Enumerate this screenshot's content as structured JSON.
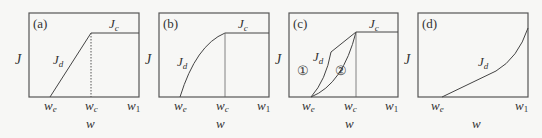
{
  "figure": {
    "panels": [
      {
        "id": "a",
        "panel_label": "(a)",
        "y_label": "J",
        "x_label": "w",
        "x_ticks": [
          "w_e",
          "w_c",
          "w_1"
        ],
        "curve_labels": {
          "jd": "J",
          "jd_sub": "d",
          "jc": "J",
          "jc_sub": "c"
        },
        "description": "Linear rise of J_d from w_e to w_c, then constant J_c"
      },
      {
        "id": "b",
        "panel_label": "(b)",
        "y_label": "J",
        "x_label": "w",
        "x_ticks": [
          "w_e",
          "w_c",
          "w_1"
        ],
        "curve_labels": {
          "jd": "J",
          "jd_sub": "d",
          "jc": "J",
          "jc_sub": "c"
        },
        "description": "Concave-down rise of J_d from w_e to w_c, then constant J_c"
      },
      {
        "id": "c",
        "panel_label": "(c)",
        "y_label": "J",
        "x_label": "w",
        "x_ticks": [
          "w_e",
          "w_c",
          "w_1"
        ],
        "curve_labels": {
          "jd": "J",
          "jd_sub": "d",
          "jc": "J",
          "jc_sub": "c"
        },
        "markers": [
          "①",
          "②"
        ],
        "description": "Two J_d paths (1: steep then linear, 2: concave-up) from w_e to w_c, then constant J_c"
      },
      {
        "id": "d",
        "panel_label": "(d)",
        "y_label": "J",
        "x_label": "w",
        "x_ticks": [
          "w_e",
          "w_1"
        ],
        "curve_labels": {
          "jd": "J",
          "jd_sub": "d"
        },
        "description": "J_d rises linearly from w_e then curves upward toward w_1"
      }
    ],
    "tick_text": {
      "w": "w",
      "e": "e",
      "c": "c",
      "one": "1"
    },
    "colors": {
      "axes": "#444444",
      "curve": "#444444",
      "marker": "#666666",
      "background": "#f7f7f5"
    }
  }
}
